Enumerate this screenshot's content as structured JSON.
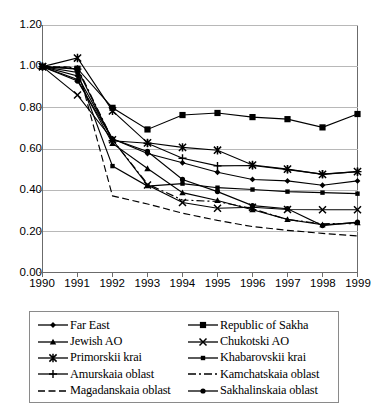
{
  "chart_data": {
    "type": "line",
    "title": "",
    "xlabel": "",
    "ylabel": "",
    "x": [
      1990,
      1991,
      1992,
      1993,
      1994,
      1995,
      1996,
      1997,
      1998,
      1999
    ],
    "xtick_labels": [
      "1990",
      "1991",
      "1992",
      "1993",
      "1994",
      "1995",
      "1996",
      "1997",
      "1998",
      "1999"
    ],
    "ytick_labels": [
      "0.00",
      "0.20",
      "0.40",
      "0.60",
      "0.80",
      "1.00",
      "1.20"
    ],
    "ytick_values": [
      0.0,
      0.2,
      0.4,
      0.6,
      0.8,
      1.0,
      1.2
    ],
    "ylim": [
      0.0,
      1.2
    ],
    "xlim": [
      1990,
      1999
    ],
    "grid": "horizontal",
    "legend_position": "bottom",
    "legend_columns": 2,
    "series": [
      {
        "name": "Far East",
        "marker": "diamond",
        "line": "solid",
        "values": [
          1.0,
          0.955,
          0.65,
          0.578,
          0.533,
          0.487,
          0.452,
          0.445,
          0.424,
          0.445
        ]
      },
      {
        "name": "Republic of Sakha",
        "marker": "square",
        "line": "solid",
        "values": [
          1.0,
          0.99,
          0.8,
          0.695,
          0.765,
          0.775,
          0.755,
          0.745,
          0.705,
          0.77
        ]
      },
      {
        "name": "Jewish AO",
        "marker": "triangle",
        "line": "solid",
        "values": [
          1.0,
          0.938,
          0.627,
          0.505,
          0.388,
          0.35,
          0.305,
          0.258,
          0.232,
          0.242
        ]
      },
      {
        "name": "Chukotski AO",
        "marker": "x",
        "line": "solid",
        "values": [
          1.0,
          0.862,
          0.645,
          0.425,
          0.34,
          0.312,
          0.317,
          0.306,
          0.305,
          0.305
        ]
      },
      {
        "name": "Primorskii krai",
        "marker": "asterisk",
        "line": "solid",
        "values": [
          1.0,
          1.042,
          0.785,
          0.63,
          0.608,
          0.594,
          0.522,
          0.502,
          0.477,
          0.49
        ]
      },
      {
        "name": "Khabarovskii krai",
        "marker": "dot",
        "line": "solid",
        "values": [
          1.0,
          0.972,
          0.517,
          0.42,
          0.432,
          0.412,
          0.403,
          0.393,
          0.388,
          0.383
        ]
      },
      {
        "name": "Amurskaia oblast",
        "marker": "plus",
        "line": "solid",
        "values": [
          1.0,
          0.988,
          0.64,
          0.628,
          0.555,
          0.518,
          0.52,
          0.5,
          0.478,
          0.49
        ]
      },
      {
        "name": "Kamchatskaia oblast",
        "marker": "none",
        "line": "dashdot",
        "values": [
          1.0,
          0.995,
          0.645,
          0.43,
          0.352,
          0.345,
          0.31,
          0.257,
          0.237,
          0.238
        ]
      },
      {
        "name": "Magadanskaia oblast",
        "marker": "none",
        "line": "dashed",
        "values": [
          1.0,
          0.998,
          0.372,
          0.333,
          0.288,
          0.253,
          0.223,
          0.205,
          0.19,
          0.178
        ]
      },
      {
        "name": "Sakhalinskaia oblast",
        "marker": "circle",
        "line": "solid",
        "values": [
          1.0,
          0.93,
          0.648,
          0.588,
          0.452,
          0.393,
          0.325,
          0.31,
          0.228,
          0.245
        ]
      }
    ]
  },
  "legend": {
    "items": [
      {
        "label": "Far East",
        "marker": "diamond-marker-icon"
      },
      {
        "label": "Republic of Sakha",
        "marker": "square-marker-icon"
      },
      {
        "label": "Jewish AO",
        "marker": "triangle-marker-icon"
      },
      {
        "label": "Chukotski AO",
        "marker": "x-marker-icon"
      },
      {
        "label": "Primorskii krai",
        "marker": "asterisk-marker-icon"
      },
      {
        "label": "Khabarovskii krai",
        "marker": "dot-marker-icon"
      },
      {
        "label": "Amurskaia oblast",
        "marker": "plus-marker-icon"
      },
      {
        "label": "Kamchatskaia oblast",
        "marker": "dashdot-line-icon"
      },
      {
        "label": "Magadanskaia oblast",
        "marker": "dashed-line-icon"
      },
      {
        "label": "Sakhalinskaia oblast",
        "marker": "circle-marker-icon"
      }
    ]
  },
  "colors": {
    "ink": "#000000",
    "frame": "#6b6b6b",
    "grid": "#b8b8b8"
  }
}
